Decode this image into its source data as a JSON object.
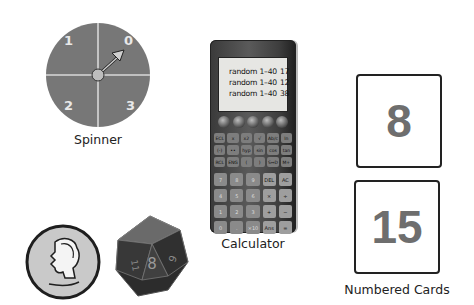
{
  "spinner": {
    "label": "Spinner",
    "sections": [
      "0",
      "1",
      "2",
      "3"
    ],
    "pointer_at": "0",
    "colors": {
      "face": "#777777",
      "divider": "#d8d8d8",
      "hub": "#bdbdbd"
    }
  },
  "calculator": {
    "label": "Calculator",
    "screen_lines": [
      {
        "cmd": "random 1–40",
        "value": "17"
      },
      {
        "cmd": "random 1–40",
        "value": "12"
      },
      {
        "cmd": "random 1–40",
        "value": "38"
      }
    ],
    "function_keys": [
      "ECL",
      "x",
      "x2",
      "√",
      "Ab/c",
      "ln",
      "(-)",
      "••",
      "hyp",
      "sin",
      "cos",
      "tan",
      "RCL",
      "ENG",
      "(",
      ")",
      "S⇔D",
      "M+"
    ],
    "number_keys": [
      "7",
      "8",
      "9",
      "DEL",
      "AC",
      "4",
      "5",
      "6",
      "×",
      "÷",
      "1",
      "2",
      "3",
      "+",
      "−",
      "0",
      ".",
      "×10",
      "Ans",
      "="
    ]
  },
  "coin": {
    "name": "quarter",
    "depiction": "Washington profile"
  },
  "die": {
    "name": "d20 icosahedron",
    "visible_faces": [
      "8",
      "9",
      "11",
      "7",
      "10"
    ]
  },
  "numbered_cards": {
    "label": "Numbered Cards",
    "cards": [
      "8",
      "15"
    ]
  }
}
